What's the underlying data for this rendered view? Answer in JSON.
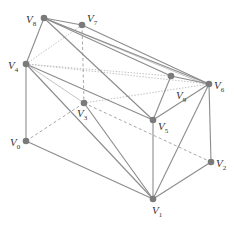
{
  "diagram": {
    "title": "",
    "vertices": [
      {
        "id": "V0",
        "name": "V",
        "sub": "0",
        "x": 26,
        "y": 141,
        "lx": 10,
        "ly": 146
      },
      {
        "id": "V1",
        "name": "V",
        "sub": "1",
        "x": 153,
        "y": 199,
        "lx": 152,
        "ly": 214
      },
      {
        "id": "V2",
        "name": "V",
        "sub": "2",
        "x": 211,
        "y": 162,
        "lx": 216,
        "ly": 167
      },
      {
        "id": "V3",
        "name": "V",
        "sub": "3",
        "x": 84,
        "y": 103,
        "lx": 77,
        "ly": 117
      },
      {
        "id": "V4",
        "name": "V",
        "sub": "4",
        "x": 26,
        "y": 64,
        "lx": 8,
        "ly": 69
      },
      {
        "id": "V5",
        "name": "V",
        "sub": "5",
        "x": 153,
        "y": 120,
        "lx": 158,
        "ly": 130
      },
      {
        "id": "V6",
        "name": "V",
        "sub": "6",
        "x": 209,
        "y": 84,
        "lx": 214,
        "ly": 89
      },
      {
        "id": "V7",
        "name": "V",
        "sub": "7",
        "x": 82,
        "y": 25,
        "lx": 87,
        "ly": 22
      },
      {
        "id": "V8",
        "name": "V",
        "sub": "8",
        "x": 44,
        "y": 18,
        "lx": 26,
        "ly": 23
      },
      {
        "id": "V9",
        "name": "V",
        "sub": "9",
        "x": 171,
        "y": 76,
        "lx": 176,
        "ly": 99
      }
    ],
    "edges_solid": [
      [
        "V8",
        "V7"
      ],
      [
        "V8",
        "V4"
      ],
      [
        "V8",
        "V9"
      ],
      [
        "V8",
        "V6"
      ],
      [
        "V8",
        "V5"
      ],
      [
        "V7",
        "V6"
      ],
      [
        "V4",
        "V0"
      ],
      [
        "V4",
        "V5"
      ],
      [
        "V4",
        "V1"
      ],
      [
        "V0",
        "V1"
      ],
      [
        "V1",
        "V2"
      ],
      [
        "V1",
        "V5"
      ],
      [
        "V1",
        "V6"
      ],
      [
        "V2",
        "V6"
      ],
      [
        "V5",
        "V6"
      ],
      [
        "V5",
        "V9"
      ],
      [
        "V9",
        "V6"
      ],
      [
        "V3",
        "V1"
      ]
    ],
    "edges_light": [
      [
        "V8",
        "V6b"
      ],
      [
        "V4",
        "V3"
      ]
    ],
    "edges_dashed": [
      [
        "V0",
        "V3"
      ],
      [
        "V3",
        "V2"
      ],
      [
        "V7",
        "V3"
      ]
    ],
    "edges_dotted": [
      [
        "V4",
        "V7"
      ],
      [
        "V4",
        "V6"
      ],
      [
        "V3",
        "V6"
      ],
      [
        "V4",
        "V9"
      ]
    ],
    "colors": {
      "edge": "#8c8c8c",
      "vertex": "#7a7a7a",
      "label": "#333333",
      "background": "#ffffff"
    }
  }
}
